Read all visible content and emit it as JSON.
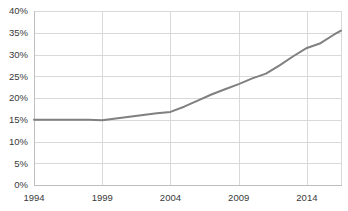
{
  "chart_data": {
    "type": "line",
    "title": "",
    "subtitle": "",
    "xlabel": "",
    "ylabel": "",
    "xlim": [
      1994,
      2016.5
    ],
    "ylim": [
      0,
      40
    ],
    "grid": true,
    "grid_axis": "both",
    "legend": false,
    "legend_position": "none",
    "y_tick_labels": [
      "0%",
      "5%",
      "10%",
      "15%",
      "20%",
      "25%",
      "30%",
      "35%",
      "40%"
    ],
    "y_tick_values": [
      0,
      5,
      10,
      15,
      20,
      25,
      30,
      35,
      40
    ],
    "x_tick_labels": [
      "1994",
      "1999",
      "2004",
      "2009",
      "2014"
    ],
    "x_tick_values": [
      1994,
      1999,
      2004,
      2009,
      2014
    ],
    "series": [
      {
        "name": "",
        "color": "#808080",
        "x": [
          1994,
          1995,
          1996,
          1997,
          1998,
          1999,
          2000,
          2001,
          2002,
          2003,
          2004,
          2005,
          2006,
          2007,
          2008,
          2009,
          2010,
          2011,
          2012,
          2013,
          2014,
          2015,
          2016,
          2016.5
        ],
        "values": [
          15.0,
          15.0,
          15.0,
          15.0,
          15.0,
          14.9,
          15.3,
          15.7,
          16.1,
          16.5,
          16.8,
          18.0,
          19.4,
          20.8,
          22.0,
          23.2,
          24.5,
          25.6,
          27.5,
          29.6,
          31.5,
          32.6,
          34.6,
          35.5
        ]
      }
    ]
  },
  "axes": {
    "plot_left": 34,
    "plot_right": 341,
    "plot_top": 11,
    "plot_bottom": 185
  },
  "colors": {
    "line": "#808080",
    "grid": "#d9d9d9",
    "axis": "#bfbfbf",
    "text": "#3a3a3a",
    "background": "#ffffff"
  }
}
